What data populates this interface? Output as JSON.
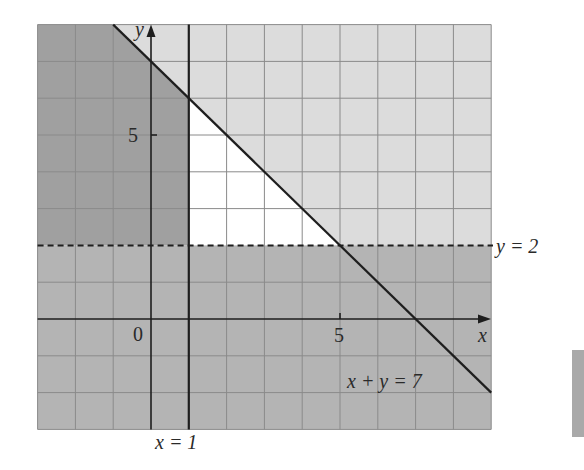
{
  "figure": {
    "type": "linear-inequality-feasible-region",
    "axes": {
      "x_label": "x",
      "y_label": "y",
      "origin_label": "0",
      "x_tick_label": "5",
      "y_tick_label": "5",
      "x_range": [
        -3,
        9
      ],
      "y_range": [
        -3,
        8
      ]
    },
    "lines": [
      {
        "name": "x + y = 7",
        "label": "x + y = 7",
        "style": "solid"
      },
      {
        "name": "x = 1",
        "label": "x = 1",
        "style": "solid"
      },
      {
        "name": "y = 2",
        "label": "y = 2",
        "style": "dashed"
      }
    ],
    "feasible_region": {
      "vertices": [
        [
          1,
          6
        ],
        [
          1,
          2
        ],
        [
          5,
          2
        ]
      ],
      "fill": "#ffffff"
    },
    "colors": {
      "dark_shade": "#9f9f9f",
      "mid_shade": "#b4b4b4",
      "light_shade": "#dcdcdc",
      "grid": "#8c8c8c",
      "line": "#1e1e1e"
    }
  }
}
